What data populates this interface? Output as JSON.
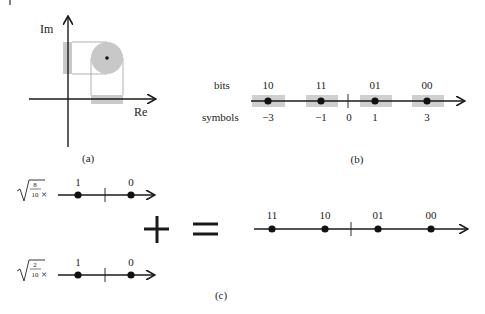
{
  "panel_a": {
    "caption": "(a)",
    "axis_re": "Re",
    "axis_im": "Im"
  },
  "panel_b": {
    "caption": "(b)",
    "row_bits_label": "bits",
    "row_symbols_label": "symbols",
    "points": [
      {
        "bits": "10",
        "symbol": "−3"
      },
      {
        "bits": "11",
        "symbol": "−1"
      },
      {
        "bits": "01",
        "symbol": "1"
      },
      {
        "bits": "00",
        "symbol": "3"
      }
    ],
    "origin_label": "0"
  },
  "panel_c": {
    "caption": "(c)",
    "top_factor_num": "8",
    "top_factor_den": "10",
    "bottom_factor_num": "2",
    "bottom_factor_den": "10",
    "times": "×",
    "top_points": [
      "1",
      "0"
    ],
    "bottom_points": [
      "1",
      "0"
    ],
    "plus": "+",
    "equals": "=",
    "result_points": [
      "11",
      "10",
      "01",
      "00"
    ]
  },
  "colors": {
    "ink": "#1a1a1a",
    "shade": "#cfcfcf",
    "circle": "#c8c8c8",
    "dash": "#9a9a9a"
  }
}
